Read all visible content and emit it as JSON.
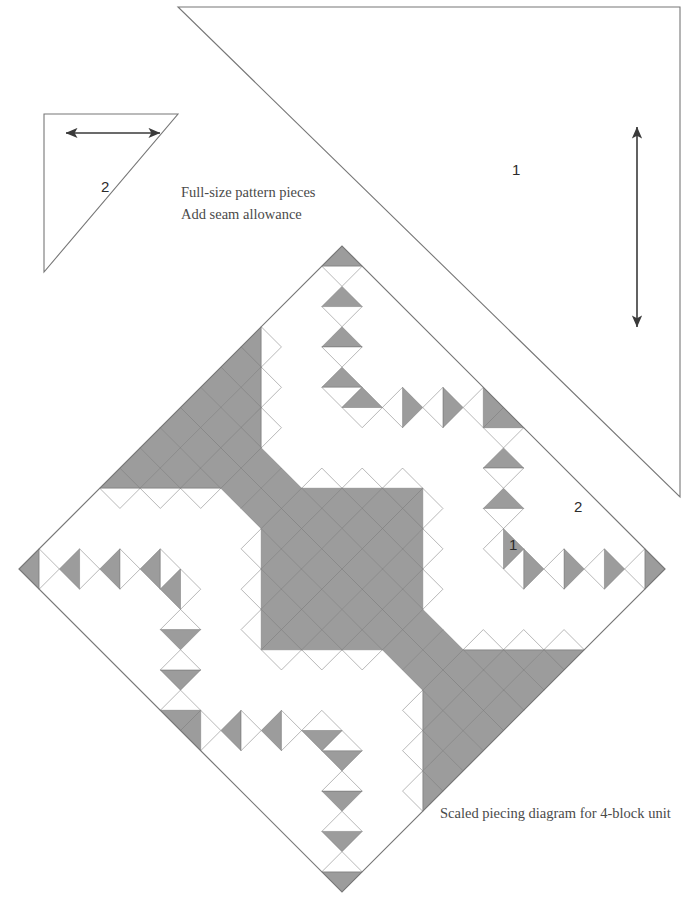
{
  "figure": {
    "kind": "quilt-pattern-sheet",
    "background": "#ffffff",
    "fabric_gray": "#9c9c9c",
    "fabric_white": "#ffffff",
    "outline_color": "#777777",
    "arrow_color": "#3a3a3a"
  },
  "captions": {
    "line1": "Full-size pattern pieces",
    "line2": "Add seam allowance",
    "diagram": "Scaled piecing diagram for 4-block unit"
  },
  "pattern_pieces": [
    {
      "id": "piece-2",
      "label": "2",
      "label_x": 101,
      "label_y": 178,
      "points": "44,114 178,114 44,272",
      "grainline": {
        "x1": 66,
        "y1": 133,
        "x2": 160,
        "y2": 133,
        "orientation": "horizontal"
      }
    },
    {
      "id": "piece-1",
      "label": "1",
      "label_x": 512,
      "label_y": 161,
      "points": "178,7 680,7 680,497",
      "grainline": {
        "x1": 637,
        "y1": 127,
        "x2": 637,
        "y2": 327,
        "orientation": "vertical"
      }
    }
  ],
  "diagram": {
    "center_x": 342,
    "center_y": 569,
    "half_diagonal_x": 338,
    "half_diagonal_y": 323,
    "rotation_deg": 45,
    "grid_per_block": 8,
    "blocks": 4,
    "block_name": "delectable-mountains",
    "labels": [
      {
        "text": "1",
        "x": 509,
        "y": 536
      },
      {
        "text": "2",
        "x": 574,
        "y": 498
      }
    ]
  },
  "chart_data": {
    "type": "table",
    "rows": [
      {
        "piece": "1",
        "shape": "large right triangle",
        "note": "full-size pattern piece, add seam allowance"
      },
      {
        "piece": "2",
        "shape": "small right triangle",
        "note": "full-size pattern piece, add seam allowance"
      }
    ]
  }
}
